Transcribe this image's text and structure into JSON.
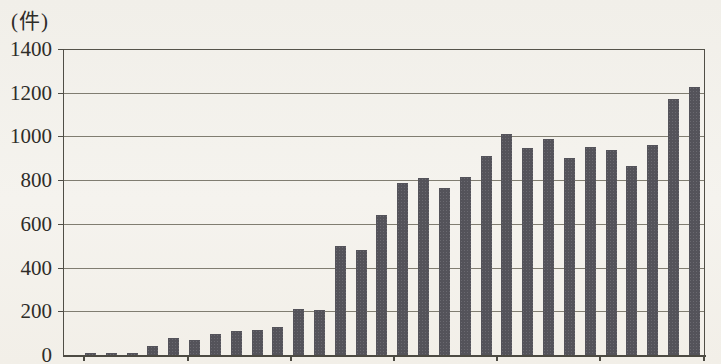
{
  "page": {
    "background_color": "#f3f1ec",
    "text_color": "#2e2c28"
  },
  "chart_data": {
    "type": "bar",
    "title": "",
    "ylabel": "(件)",
    "xlabel": "",
    "ylim": [
      0,
      1400
    ],
    "ytick_step": 200,
    "yticks": [
      1400,
      1200,
      1000,
      800,
      600,
      400,
      200,
      0
    ],
    "grid": true,
    "legend": "none",
    "n_bars": 30,
    "x_axis_labels_visible": false,
    "x_tick_marks": "7 unlabeled tick marks dividing the 30 bars into groups of 5",
    "bar_color": "#54535a",
    "values": [
      10,
      10,
      8,
      40,
      80,
      70,
      95,
      110,
      115,
      130,
      210,
      205,
      500,
      480,
      640,
      785,
      810,
      765,
      815,
      910,
      1010,
      945,
      990,
      900,
      950,
      940,
      865,
      960,
      1170,
      1225
    ]
  }
}
